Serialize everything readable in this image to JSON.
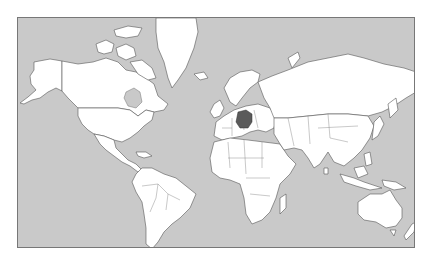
{
  "map": {
    "type": "world-locator-map",
    "projection": "mercator",
    "highlighted_country": "Germany",
    "colors": {
      "ocean": "#c9c9c9",
      "land": "#ffffff",
      "border": "#555555",
      "highlight": "#5a5a5a",
      "frame": "#777777",
      "page_background": "#ffffff"
    }
  }
}
